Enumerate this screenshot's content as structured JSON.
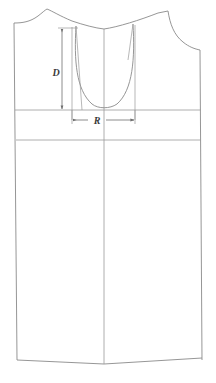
{
  "diagram": {
    "kind": "garment-pattern-technical-drawing",
    "title": "",
    "background_color": "#ffffff",
    "line_color": "#8a8a8a",
    "dimension_line_color": "#6f6f6f",
    "label_color": "#3a3a3a",
    "labels": {
      "depth": "D",
      "radius": "R"
    },
    "annotations": [
      {
        "name": "neckline-depth",
        "symbol": "D",
        "orientation": "vertical",
        "arrow_ends": "both",
        "from": {
          "x": 62,
          "y": 28
        },
        "to": {
          "x": 62,
          "y": 110
        },
        "label_position": {
          "x": 57,
          "y": 73
        }
      },
      {
        "name": "neckline-width",
        "symbol": "R",
        "orientation": "horizontal",
        "arrow_ends": "both",
        "from": {
          "x": 72,
          "y": 120
        },
        "to": {
          "x": 135,
          "y": 120
        },
        "label_position": {
          "x": 97,
          "y": 123
        }
      }
    ],
    "construction_lines": {
      "center_front_x": 104,
      "chest_line_y": 110,
      "waist_line_y": 140,
      "left_side_seam_x": 14,
      "right_side_seam_x": 200,
      "hem_y": 360
    }
  }
}
